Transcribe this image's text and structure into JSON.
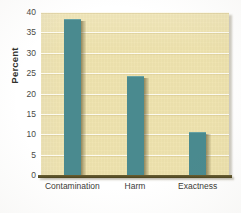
{
  "chart_data": {
    "type": "bar",
    "title": "",
    "subtitle": "",
    "xlabel": "",
    "ylabel": "Percent",
    "categories": [
      "Contamination",
      "Harm",
      "Exactness"
    ],
    "values": [
      38,
      24,
      10.3
    ],
    "series": [
      {
        "name": "Percent",
        "values": [
          38,
          24,
          10.3
        ]
      }
    ],
    "ylim": [
      0,
      40
    ],
    "ytick_labels": [
      "0",
      "5",
      "10",
      "15",
      "20",
      "25",
      "30",
      "35",
      "40"
    ],
    "ytick_values": [
      0,
      5,
      10,
      15,
      20,
      25,
      30,
      35,
      40
    ],
    "grid": true,
    "grid_axis": "y",
    "grid_color": "#fdfbf0",
    "legend": false,
    "legend_position": "none",
    "annotations": [],
    "bar_color": "#4a8a8f",
    "plot_background_color": "#efe3ae",
    "figure_background_color": "#ffffff",
    "axis_color": "#4b4320",
    "tick_label_color": "#4a4a46"
  }
}
